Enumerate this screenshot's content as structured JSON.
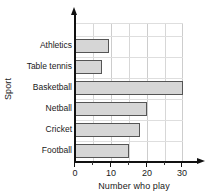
{
  "chart_data": {
    "type": "bar",
    "orientation": "horizontal",
    "title": "",
    "xlabel": "Number who play",
    "ylabel": "Sport",
    "categories": [
      "Athletics",
      "Table tennis",
      "Basketball",
      "Netball",
      "Cricket",
      "Football"
    ],
    "values": [
      9.5,
      7.5,
      30,
      20,
      18,
      15
    ],
    "xlim": [
      0,
      30
    ],
    "xticks": [
      0,
      10,
      20,
      30
    ],
    "xtick_labels": [
      "0",
      "10",
      "20",
      "30"
    ],
    "minor_tick_step": 5,
    "grid": true,
    "legend": null,
    "bar_fill_color": "#d6d6d6",
    "bar_edge_color": "#555555",
    "axis_color": "#111111",
    "grid_color": "#d7d7d7"
  }
}
